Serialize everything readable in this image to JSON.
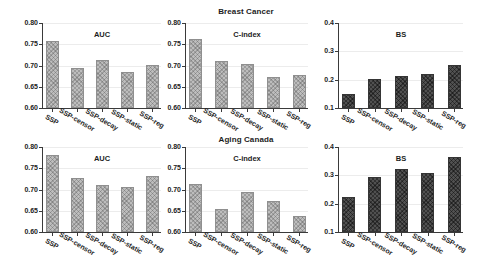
{
  "figure": {
    "rows": [
      {
        "title": "Breast Cancer"
      },
      {
        "title": "Aging Canada"
      }
    ]
  },
  "colors": {
    "background": "#ffffff",
    "bar_light_fill": "#bdbdbd",
    "bar_light_edge": "#8f8f8f",
    "bar_dark_fill": "#515151",
    "bar_dark_edge": "#353535",
    "axis": "#3a3a3a",
    "gridline": "#ececec",
    "text": "#1c1c1c"
  },
  "chart_data": [
    {
      "type": "bar",
      "dataset": "Breast Cancer",
      "title": "AUC",
      "categories": [
        "SSP",
        "SSP-censor",
        "SSP-decay",
        "SSP-static",
        "SSP-reg"
      ],
      "values": [
        0.757,
        0.694,
        0.712,
        0.684,
        0.701
      ],
      "ylim": [
        0.6,
        0.8
      ],
      "yticks": [
        "0.60",
        "0.65",
        "0.70",
        "0.75",
        "0.80"
      ],
      "grid": true,
      "legend": "none",
      "bar_style": "light"
    },
    {
      "type": "bar",
      "dataset": "Breast Cancer",
      "title": "C-index",
      "categories": [
        "SSP",
        "SSP-censor",
        "SSP-decay",
        "SSP-static",
        "SSP-reg"
      ],
      "values": [
        0.762,
        0.711,
        0.704,
        0.673,
        0.678
      ],
      "ylim": [
        0.6,
        0.8
      ],
      "yticks": [
        "0.60",
        "0.65",
        "0.70",
        "0.75",
        "0.80"
      ],
      "grid": true,
      "legend": "none",
      "bar_style": "light"
    },
    {
      "type": "bar",
      "dataset": "Breast Cancer",
      "title": "BS",
      "categories": [
        "SSP",
        "SSP-censor",
        "SSP-decay",
        "SSP-static",
        "SSP-reg"
      ],
      "values": [
        0.151,
        0.202,
        0.212,
        0.221,
        0.253
      ],
      "ylim": [
        0.1,
        0.4
      ],
      "yticks": [
        "0.1",
        "0.2",
        "0.3",
        "0.4"
      ],
      "grid": true,
      "legend": "none",
      "bar_style": "dark"
    },
    {
      "type": "bar",
      "dataset": "Aging Canada",
      "title": "AUC",
      "categories": [
        "SSP",
        "SSP-censor",
        "SSP-decay",
        "SSP-static",
        "SSP-reg"
      ],
      "values": [
        0.781,
        0.728,
        0.711,
        0.705,
        0.731
      ],
      "ylim": [
        0.6,
        0.8
      ],
      "yticks": [
        "0.60",
        "0.65",
        "0.70",
        "0.75",
        "0.80"
      ],
      "grid": true,
      "legend": "none",
      "bar_style": "light"
    },
    {
      "type": "bar",
      "dataset": "Aging Canada",
      "title": "C-index",
      "categories": [
        "SSP",
        "SSP-censor",
        "SSP-decay",
        "SSP-static",
        "SSP-reg"
      ],
      "values": [
        0.712,
        0.654,
        0.694,
        0.672,
        0.638
      ],
      "ylim": [
        0.6,
        0.8
      ],
      "yticks": [
        "0.60",
        "0.65",
        "0.70",
        "0.75",
        "0.80"
      ],
      "grid": true,
      "legend": "none",
      "bar_style": "light"
    },
    {
      "type": "bar",
      "dataset": "Aging Canada",
      "title": "BS",
      "categories": [
        "SSP",
        "SSP-censor",
        "SSP-decay",
        "SSP-static",
        "SSP-reg"
      ],
      "values": [
        0.223,
        0.293,
        0.322,
        0.309,
        0.364
      ],
      "ylim": [
        0.1,
        0.4
      ],
      "yticks": [
        "0.1",
        "0.2",
        "0.3",
        "0.4"
      ],
      "grid": true,
      "legend": "none",
      "bar_style": "dark"
    }
  ]
}
